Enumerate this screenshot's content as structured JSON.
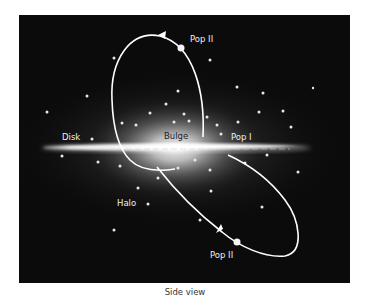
{
  "figure": {
    "caption": "Side view",
    "colors": {
      "background": "#0b0b0b",
      "glow": "#ffffff",
      "orbit": "#ffffff",
      "label": "#f0f0f0",
      "bulge_label": "#1a1a1a"
    },
    "labels": {
      "disk": "Disk",
      "bulge": "Bulge",
      "pop1": "Pop I",
      "halo": "Halo",
      "pop2_upper": "Pop II",
      "pop2_lower": "Pop II"
    },
    "components": [
      {
        "name": "disk",
        "description": "thin bright galactic disk seen edge-on"
      },
      {
        "name": "bulge",
        "description": "bright central glow"
      },
      {
        "name": "halo",
        "description": "scattered stars (globular clusters) around galaxy"
      },
      {
        "name": "pop2-orbit-upper",
        "description": "elliptical orbit above plane with arrow and star"
      },
      {
        "name": "pop2-orbit-lower",
        "description": "elliptical orbit below plane with arrow and star"
      }
    ]
  }
}
